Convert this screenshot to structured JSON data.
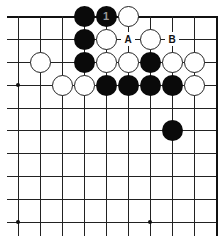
{
  "board": {
    "columns_x": [
      18,
      40,
      62,
      84,
      106,
      128,
      150,
      172,
      194,
      216
    ],
    "rows_y": [
      16,
      39,
      62,
      85,
      108,
      130,
      153,
      176,
      199,
      222
    ],
    "top_edge": true,
    "right_edge": true,
    "colors": {
      "line": "#222222",
      "black_stone": "#0a0a0a",
      "white_stone": "#ffffff",
      "background": "#ffffff"
    }
  },
  "hoshi": [
    {
      "col": 0,
      "row": 3
    },
    {
      "col": 0,
      "row": 9
    },
    {
      "col": 6,
      "row": 9
    }
  ],
  "stones": [
    {
      "color": "black",
      "col": 3,
      "row": 0,
      "label": ""
    },
    {
      "color": "black",
      "col": 4,
      "row": 0,
      "label": "1"
    },
    {
      "color": "white",
      "col": 5,
      "row": 0,
      "label": ""
    },
    {
      "color": "black",
      "col": 3,
      "row": 1,
      "label": ""
    },
    {
      "color": "white",
      "col": 4,
      "row": 1,
      "label": ""
    },
    {
      "color": "white",
      "col": 6,
      "row": 1,
      "label": ""
    },
    {
      "color": "white",
      "col": 1,
      "row": 2,
      "label": ""
    },
    {
      "color": "black",
      "col": 3,
      "row": 2,
      "label": ""
    },
    {
      "color": "white",
      "col": 4,
      "row": 2,
      "label": ""
    },
    {
      "color": "white",
      "col": 5,
      "row": 2,
      "label": ""
    },
    {
      "color": "black",
      "col": 6,
      "row": 2,
      "label": ""
    },
    {
      "color": "white",
      "col": 7,
      "row": 2,
      "label": ""
    },
    {
      "color": "white",
      "col": 8,
      "row": 2,
      "label": ""
    },
    {
      "color": "white",
      "col": 2,
      "row": 3,
      "label": ""
    },
    {
      "color": "white",
      "col": 3,
      "row": 3,
      "label": ""
    },
    {
      "color": "black",
      "col": 4,
      "row": 3,
      "label": ""
    },
    {
      "color": "black",
      "col": 5,
      "row": 3,
      "label": ""
    },
    {
      "color": "black",
      "col": 6,
      "row": 3,
      "label": ""
    },
    {
      "color": "black",
      "col": 7,
      "row": 3,
      "label": ""
    },
    {
      "color": "white",
      "col": 8,
      "row": 3,
      "label": ""
    },
    {
      "color": "black",
      "col": 7,
      "row": 5,
      "label": ""
    }
  ],
  "labels": [
    {
      "text": "A",
      "col": 5,
      "row": 1
    },
    {
      "text": "B",
      "col": 7,
      "row": 1
    }
  ]
}
